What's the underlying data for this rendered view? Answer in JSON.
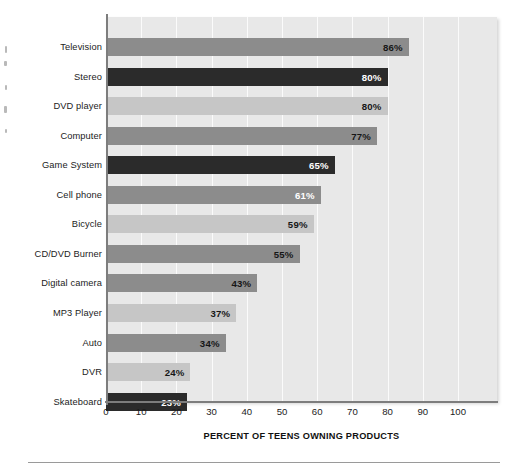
{
  "colors": {
    "panel_background": "#e8e8e8",
    "gridline": "#fbfbfb",
    "axis_line": "#7d7d7d",
    "bar_medium": "#8c8c8c",
    "bar_dark": "#2b2b2b",
    "bar_light": "#c6c6c6",
    "page_background": "#ffffff",
    "rule": "#9a9a9a"
  },
  "chart_data": {
    "type": "bar",
    "orientation": "horizontal",
    "title": "",
    "subtitle": "",
    "xlabel": "PERCENT OF TEENS OWNING PRODUCTS",
    "ylabel": "",
    "xlim": [
      0,
      100
    ],
    "xticks": [
      0,
      10,
      20,
      30,
      40,
      50,
      60,
      70,
      80,
      90,
      100
    ],
    "xtick_labels": [
      "0",
      "10",
      "20",
      "30",
      "40",
      "50",
      "60",
      "70",
      "80",
      "90",
      "100"
    ],
    "grid": "vertical",
    "legend": "none",
    "value_suffix": "%",
    "categories": [
      "Television",
      "Stereo",
      "DVD player",
      "Computer",
      "Game System",
      "Cell phone",
      "Bicycle",
      "CD/DVD Burner",
      "Digital camera",
      "MP3 Player",
      "Auto",
      "DVR",
      "Skateboard"
    ],
    "values": [
      86,
      80,
      80,
      77,
      65,
      61,
      59,
      55,
      43,
      37,
      34,
      24,
      23
    ],
    "value_labels": [
      "86%",
      "80%",
      "80%",
      "77%",
      "65%",
      "61%",
      "59%",
      "55%",
      "43%",
      "37%",
      "34%",
      "24%",
      "23%"
    ],
    "bar_tones": [
      "medium",
      "dark",
      "light",
      "medium",
      "dark",
      "medium",
      "light",
      "medium",
      "medium",
      "light",
      "medium",
      "light",
      "dark"
    ],
    "label_tones": [
      "light",
      "dark",
      "light",
      "light",
      "dark",
      "dark",
      "light",
      "light",
      "light",
      "light",
      "light",
      "light",
      "dark"
    ]
  }
}
